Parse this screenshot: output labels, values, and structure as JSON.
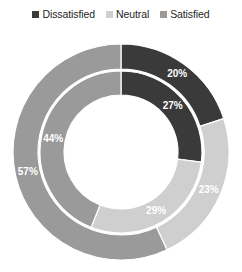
{
  "legend": {
    "items": [
      {
        "label": "Dissatisfied",
        "color": "#3a3a3a"
      },
      {
        "label": "Neutral",
        "color": "#cfcfcf"
      },
      {
        "label": "Satisfied",
        "color": "#9a9a9a"
      }
    ]
  },
  "chart_data": {
    "type": "pie",
    "variant": "nested-donut",
    "title": "",
    "subtitle": "",
    "xlabel": "",
    "ylabel": "",
    "grid": false,
    "legend_position": "top",
    "start_angle_deg": 0,
    "direction": "clockwise",
    "units": "%",
    "categories": [
      "Dissatisfied",
      "Neutral",
      "Satisfied"
    ],
    "colors": [
      "#3a3a3a",
      "#cfcfcf",
      "#9a9a9a"
    ],
    "series": [
      {
        "name": "Outer ring",
        "ring": "outer",
        "values": [
          20,
          23,
          57
        ],
        "labels": [
          "20%",
          "23%",
          "57%"
        ]
      },
      {
        "name": "Inner ring",
        "ring": "inner",
        "values": [
          27,
          29,
          44
        ],
        "labels": [
          "27%",
          "29%",
          "44%"
        ]
      }
    ],
    "geometry": {
      "center_x": 121,
      "center_y": 126,
      "outer_ring_outer_radius": 108,
      "outer_ring_inner_radius": 83,
      "inner_ring_outer_radius": 81,
      "inner_ring_inner_radius": 57
    },
    "labels_flat": [
      "20%",
      "27%",
      "23%",
      "29%",
      "44%",
      "57%"
    ]
  }
}
